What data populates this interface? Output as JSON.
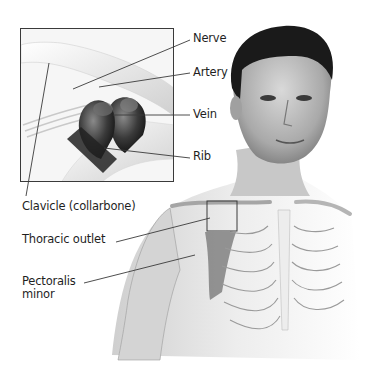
{
  "figure": {
    "inset_labels": [
      {
        "id": "nerve",
        "text": "Nerve"
      },
      {
        "id": "artery",
        "text": "Artery"
      },
      {
        "id": "vein",
        "text": "Vein"
      },
      {
        "id": "rib",
        "text": "Rib"
      }
    ],
    "body_labels": [
      {
        "id": "clavicle",
        "text": "Clavicle (collarbone)"
      },
      {
        "id": "thoracic-outlet",
        "text": "Thoracic outlet"
      },
      {
        "id": "pectoralis-minor",
        "text": "Pectoralis minor"
      }
    ]
  },
  "colors": {
    "background": "#ffffff",
    "line": "#3a3a3a",
    "text": "#1f1f1f",
    "hair": "#1a1a1a",
    "skin_light": "#e8e8e8",
    "skin_mid": "#b8b8b8",
    "vessel_dark": "#2a2a2a"
  }
}
